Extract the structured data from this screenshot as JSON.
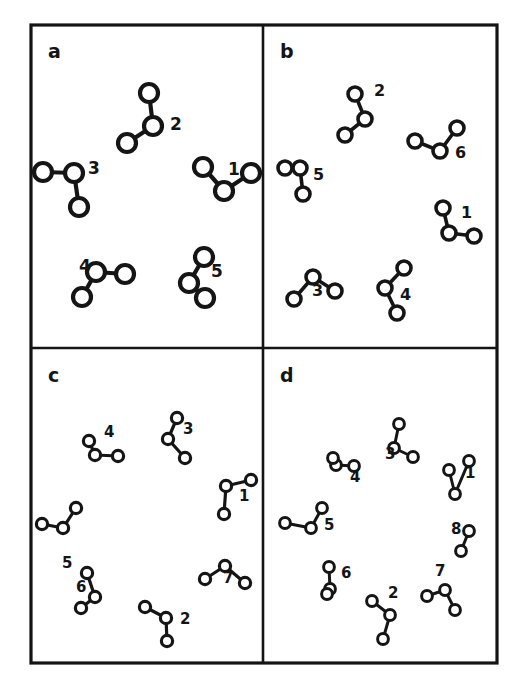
{
  "figure": {
    "title": "",
    "background_color": "#ffffff",
    "ink_color": "#151515",
    "node_fill": "#ffffff",
    "frame": {
      "x": 31,
      "y": 25,
      "width": 466,
      "height": 638,
      "stroke_width": 3.2
    },
    "divider_vertical_x": 263,
    "divider_horizontal_y": 348,
    "divider_stroke_width": 2.6
  },
  "panels": [
    {
      "letter": "a",
      "letter_x": 48,
      "letter_y": 58,
      "cluster_count": 5,
      "node_radius": 9.0,
      "edge_width": 4.2,
      "label_size": 17,
      "clusters": [
        {
          "label": "1",
          "label_x": 228,
          "label_y": 175,
          "hub": [
            224,
            191
          ],
          "leaves": [
            [
              203,
              167
            ],
            [
              251,
              173
            ]
          ]
        },
        {
          "label": "2",
          "label_x": 170,
          "label_y": 130,
          "hub": [
            153,
            126
          ],
          "leaves": [
            [
              149,
              93
            ],
            [
              127,
              143
            ]
          ]
        },
        {
          "label": "3",
          "label_x": 88,
          "label_y": 174,
          "hub": [
            74,
            173
          ],
          "leaves": [
            [
              43,
              172
            ],
            [
              79,
              207
            ]
          ]
        },
        {
          "label": "4",
          "label_x": 79,
          "label_y": 272,
          "hub": [
            96,
            272
          ],
          "leaves": [
            [
              125,
              274
            ],
            [
              82,
              297
            ]
          ]
        },
        {
          "label": "5",
          "label_x": 211,
          "label_y": 277,
          "hub": [
            189,
            283
          ],
          "leaves": [
            [
              204,
              257
            ],
            [
              205,
              298
            ]
          ]
        }
      ]
    },
    {
      "letter": "b",
      "letter_x": 280,
      "letter_y": 58,
      "cluster_count": 6,
      "node_radius": 7.0,
      "edge_width": 3.6,
      "label_size": 16,
      "clusters": [
        {
          "label": "1",
          "label_x": 461,
          "label_y": 218,
          "hub": [
            449,
            233
          ],
          "leaves": [
            [
              443,
              208
            ],
            [
              474,
              236
            ]
          ]
        },
        {
          "label": "2",
          "label_x": 374,
          "label_y": 96,
          "hub": [
            365,
            119
          ],
          "leaves": [
            [
              355,
              94
            ],
            [
              345,
              135
            ]
          ]
        },
        {
          "label": "3",
          "label_x": 312,
          "label_y": 296,
          "hub": [
            313,
            277
          ],
          "leaves": [
            [
              294,
              299
            ],
            [
              335,
              291
            ]
          ]
        },
        {
          "label": "4",
          "label_x": 400,
          "label_y": 300,
          "hub": [
            385,
            288
          ],
          "leaves": [
            [
              404,
              268
            ],
            [
              397,
              313
            ]
          ]
        },
        {
          "label": "5",
          "label_x": 313,
          "label_y": 180,
          "hub": [
            300,
            168
          ],
          "leaves": [
            [
              285,
              168
            ],
            [
              303,
              194
            ]
          ]
        },
        {
          "label": "6",
          "label_x": 455,
          "label_y": 158,
          "hub": [
            440,
            151
          ],
          "leaves": [
            [
              415,
              141
            ],
            [
              457,
              128
            ]
          ]
        }
      ]
    },
    {
      "letter": "c",
      "letter_x": 48,
      "letter_y": 382,
      "cluster_count": 7,
      "node_radius": 5.6,
      "edge_width": 3.2,
      "label_size": 15,
      "clusters": [
        {
          "label": "1",
          "label_x": 239,
          "label_y": 501,
          "hub": [
            226,
            486
          ],
          "leaves": [
            [
              251,
              480
            ],
            [
              224,
              514
            ]
          ]
        },
        {
          "label": "2",
          "label_x": 180,
          "label_y": 624,
          "hub": [
            166,
            618
          ],
          "leaves": [
            [
              145,
              607
            ],
            [
              167,
              641
            ]
          ]
        },
        {
          "label": "3",
          "label_x": 183,
          "label_y": 434,
          "hub": [
            168,
            439
          ],
          "leaves": [
            [
              177,
              418
            ],
            [
              185,
              458
            ]
          ]
        },
        {
          "label": "4",
          "label_x": 104,
          "label_y": 437,
          "hub": [
            95,
            455
          ],
          "leaves": [
            [
              89,
              441
            ],
            [
              118,
              456
            ]
          ]
        },
        {
          "label": "5",
          "label_x": 62,
          "label_y": 568,
          "hub": [
            63,
            528
          ],
          "leaves": [
            [
              42,
              524
            ],
            [
              76,
              508
            ]
          ]
        },
        {
          "label": "6",
          "label_x": 76,
          "label_y": 592,
          "hub": [
            95,
            597
          ],
          "leaves": [
            [
              87,
              573
            ],
            [
              81,
              608
            ]
          ]
        },
        {
          "label": "7",
          "label_x": 223,
          "label_y": 583,
          "hub": [
            225,
            566
          ],
          "leaves": [
            [
              205,
              579
            ],
            [
              245,
              583
            ]
          ]
        }
      ]
    },
    {
      "letter": "d",
      "letter_x": 280,
      "letter_y": 382,
      "cluster_count": 8,
      "node_radius": 5.4,
      "edge_width": 3.0,
      "label_size": 15,
      "clusters": [
        {
          "label": "1",
          "label_x": 465,
          "label_y": 478,
          "hub": [
            455,
            494
          ],
          "leaves": [
            [
              449,
              470
            ],
            [
              469,
              461
            ]
          ]
        },
        {
          "label": "2",
          "label_x": 388,
          "label_y": 598,
          "hub": [
            390,
            615
          ],
          "leaves": [
            [
              372,
              601
            ],
            [
              383,
              639
            ]
          ]
        },
        {
          "label": "3",
          "label_x": 385,
          "label_y": 459,
          "hub": [
            394,
            448
          ],
          "leaves": [
            [
              399,
              424
            ],
            [
              413,
              457
            ]
          ]
        },
        {
          "label": "4",
          "label_x": 350,
          "label_y": 482,
          "hub": [
            336,
            465
          ],
          "leaves": [
            [
              354,
              466
            ],
            [
              333,
              458
            ]
          ]
        },
        {
          "label": "5",
          "label_x": 324,
          "label_y": 530,
          "hub": [
            311,
            528
          ],
          "leaves": [
            [
              285,
              523
            ],
            [
              322,
              508
            ]
          ]
        },
        {
          "label": "6",
          "label_x": 341,
          "label_y": 578,
          "hub": [
            330,
            589
          ],
          "leaves": [
            [
              329,
              567
            ],
            [
              327,
              594
            ]
          ]
        },
        {
          "label": "7",
          "label_x": 435,
          "label_y": 576,
          "hub": [
            445,
            590
          ],
          "leaves": [
            [
              427,
              596
            ],
            [
              455,
              610
            ]
          ]
        },
        {
          "label": "8",
          "label_x": 451,
          "label_y": 534,
          "hub": [
            461,
            551
          ],
          "leaves": [
            [
              469,
              531
            ]
          ]
        }
      ]
    }
  ]
}
